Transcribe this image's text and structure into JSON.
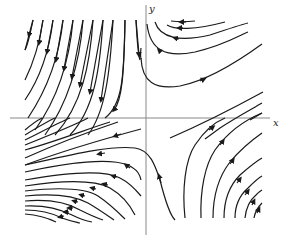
{
  "figure": {
    "type": "phase-portrait",
    "axes": {
      "x_label": "x",
      "y_label": "y"
    },
    "colors": {
      "stroke": "#1a1a1a",
      "axis": "#888888",
      "background": "#ffffff"
    }
  }
}
